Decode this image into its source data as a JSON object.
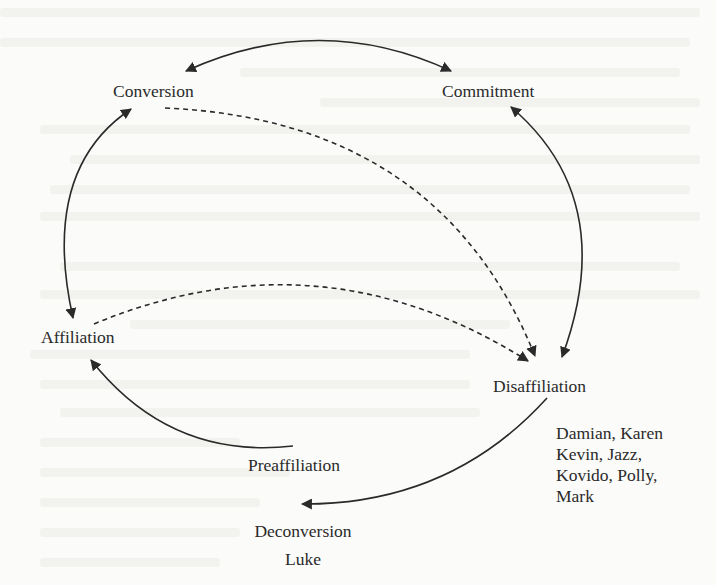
{
  "diagram": {
    "type": "cycle-flow",
    "nodes": {
      "conversion": {
        "label": "Conversion"
      },
      "commitment": {
        "label": "Commitment"
      },
      "affiliation": {
        "label": "Affiliation"
      },
      "disaffiliation": {
        "label": "Disaffiliation",
        "members": [
          "Damian, Karen",
          "Kevin, Jazz,",
          "Kovido, Polly,",
          "Mark"
        ]
      },
      "preaffiliation": {
        "label": "Preaffiliation"
      },
      "deconversion": {
        "label": "Deconversion",
        "members": [
          "Luke"
        ]
      }
    },
    "edges": [
      {
        "from": "conversion",
        "to": "commitment",
        "style": "solid",
        "direction": "both"
      },
      {
        "from": "conversion",
        "to": "affiliation",
        "style": "solid",
        "direction": "both"
      },
      {
        "from": "commitment",
        "to": "disaffiliation",
        "style": "solid",
        "direction": "both"
      },
      {
        "from": "conversion",
        "to": "disaffiliation",
        "style": "dashed",
        "direction": "forward"
      },
      {
        "from": "affiliation",
        "to": "disaffiliation",
        "style": "dashed",
        "direction": "forward"
      },
      {
        "from": "preaffiliation",
        "to": "affiliation",
        "style": "solid",
        "direction": "forward"
      },
      {
        "from": "disaffiliation",
        "to": "deconversion",
        "style": "solid",
        "direction": "forward"
      }
    ],
    "colors": {
      "background": "#fbfbf9",
      "ink": "#2a2a2a"
    }
  }
}
